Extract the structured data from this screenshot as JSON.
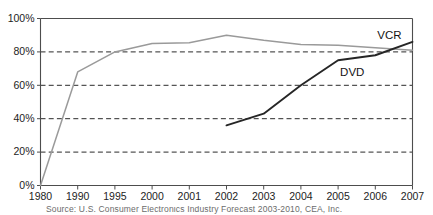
{
  "chart_data": {
    "type": "line",
    "title": "",
    "xlabel": "",
    "ylabel": "",
    "categories": [
      "1980",
      "1990",
      "1995",
      "2000",
      "2001",
      "2002",
      "2003",
      "2004",
      "2005",
      "2006",
      "2007"
    ],
    "ylim": [
      0,
      100
    ],
    "yticks": [
      0,
      20,
      40,
      60,
      80,
      100
    ],
    "ytick_labels": [
      "0%",
      "20%",
      "40%",
      "60%",
      "80%",
      "100%"
    ],
    "grid": "horizontal-dashed",
    "legend_position": "inline-labels",
    "series": [
      {
        "name": "VCR",
        "color": "#9a9a9a",
        "label_x_category": "2006",
        "values": [
          0,
          68,
          80,
          85,
          85.5,
          90,
          87,
          84.5,
          84,
          82.5,
          81
        ]
      },
      {
        "name": "DVD",
        "color": "#262626",
        "label_x_category": "2005",
        "values": [
          null,
          null,
          null,
          null,
          null,
          36,
          43,
          60,
          75,
          78,
          86
        ]
      }
    ]
  },
  "caption": {
    "text": "Source: U.S. Consumer Electronics Industry Forecast 2003-2010, CEA, Inc."
  },
  "axes": {
    "y_axis_name": "percent-of-households",
    "x_axis_name": "year"
  }
}
